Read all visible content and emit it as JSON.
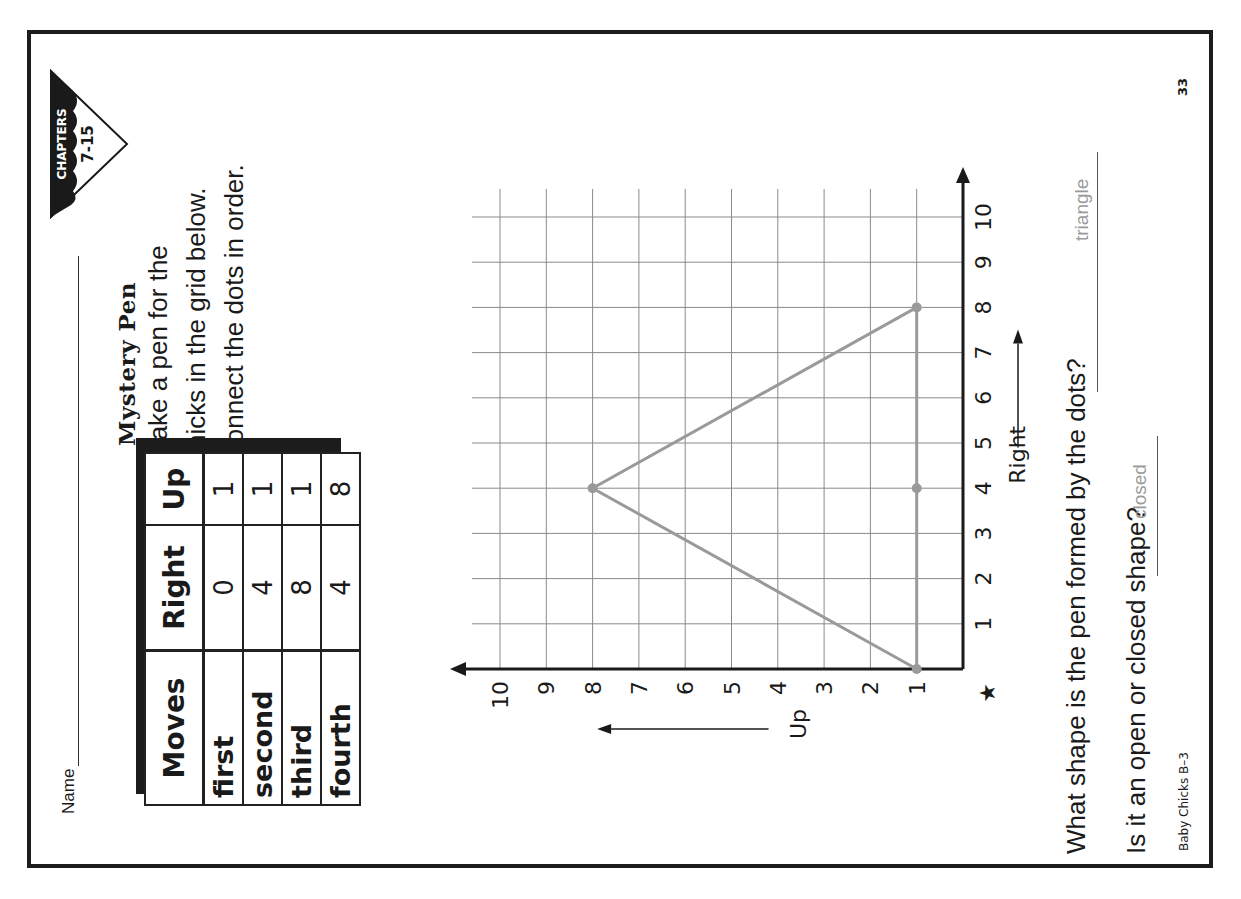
{
  "header": {
    "name_label": "Name",
    "badge": {
      "line1": "CHAPTERS",
      "line2": "7-15"
    }
  },
  "activity": {
    "title": "Mystery Pen",
    "instructions": [
      "Make a pen for the",
      "chicks in the grid below.",
      "Connect the dots in order."
    ]
  },
  "table": {
    "headers": [
      "Moves",
      "Right",
      "Up"
    ],
    "rows": [
      {
        "move": "first",
        "right": "0",
        "up": "1"
      },
      {
        "move": "second",
        "right": "4",
        "up": "1"
      },
      {
        "move": "third",
        "right": "8",
        "up": "1"
      },
      {
        "move": "fourth",
        "right": "4",
        "up": "8"
      }
    ]
  },
  "chart_data": {
    "type": "scatter",
    "xlabel": "Right",
    "ylabel": "Up",
    "xlim": [
      0,
      10
    ],
    "ylim": [
      0,
      10
    ],
    "x_ticks": [
      "1",
      "2",
      "3",
      "4",
      "5",
      "6",
      "7",
      "8",
      "9",
      "10"
    ],
    "y_ticks": [
      "1",
      "2",
      "3",
      "4",
      "5",
      "6",
      "7",
      "8",
      "9",
      "10"
    ],
    "origin_marker": "★",
    "grid": true,
    "points": [
      {
        "label": "first",
        "x": 0,
        "y": 1
      },
      {
        "label": "second",
        "x": 4,
        "y": 1
      },
      {
        "label": "third",
        "x": 8,
        "y": 1
      },
      {
        "label": "fourth",
        "x": 4,
        "y": 8
      }
    ],
    "connected_shape": "triangle",
    "line_color": "#9a9a9a"
  },
  "questions": [
    {
      "text": "What shape is the pen formed by the dots?",
      "answer": "triangle"
    },
    {
      "text": "Is it an open or closed shape?",
      "answer": "closed"
    }
  ],
  "footer": {
    "source": "Baby Chicks B–3",
    "page_number": "33"
  },
  "colors": {
    "ink": "#1a1a1a",
    "answer_gray": "#9a9a9a",
    "grid_line": "#8a8a8a"
  }
}
